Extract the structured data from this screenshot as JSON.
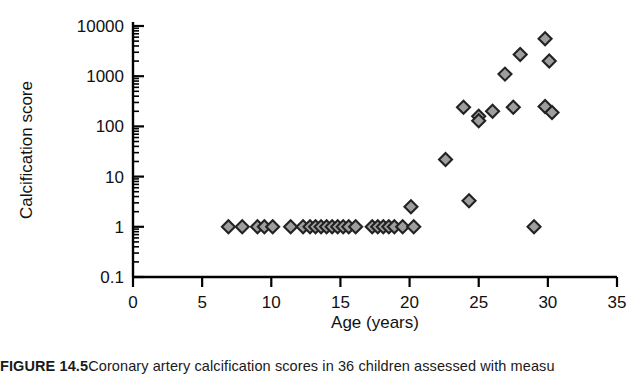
{
  "figure": {
    "caption_label": "FIGURE 14.5",
    "caption_text": "Coronary artery calcification scores in 36 children assessed with measu"
  },
  "chart_data": {
    "type": "scatter",
    "title": "",
    "xlabel": "Age (years)",
    "ylabel": "Calcification score",
    "xlim": [
      0,
      35
    ],
    "ylim": [
      0.1,
      10000
    ],
    "yscale": "log",
    "grid": false,
    "legend": "none",
    "xticks": [
      0,
      5,
      10,
      15,
      20,
      25,
      30,
      35
    ],
    "xtick_labels": [
      "0",
      "5",
      "10",
      "15",
      "20",
      "25",
      "30",
      "35"
    ],
    "yticks": [
      0.1,
      1,
      10,
      100,
      1000,
      10000
    ],
    "ytick_labels": [
      "0.1",
      "1",
      "10",
      "100",
      "1000",
      "10000"
    ],
    "y_minor_ticks": true,
    "marker": "diamond",
    "marker_fill": "#9e9e9e",
    "marker_edge": "#222222",
    "marker_size": 11,
    "points": [
      {
        "x": 6.9,
        "y": 1
      },
      {
        "x": 7.9,
        "y": 1
      },
      {
        "x": 9.0,
        "y": 1
      },
      {
        "x": 9.5,
        "y": 1
      },
      {
        "x": 10.1,
        "y": 1
      },
      {
        "x": 11.4,
        "y": 1
      },
      {
        "x": 12.3,
        "y": 1
      },
      {
        "x": 12.8,
        "y": 1
      },
      {
        "x": 13.2,
        "y": 1
      },
      {
        "x": 13.6,
        "y": 1
      },
      {
        "x": 14.0,
        "y": 1
      },
      {
        "x": 14.4,
        "y": 1
      },
      {
        "x": 14.8,
        "y": 1
      },
      {
        "x": 15.2,
        "y": 1
      },
      {
        "x": 15.6,
        "y": 1
      },
      {
        "x": 16.1,
        "y": 1
      },
      {
        "x": 17.3,
        "y": 1
      },
      {
        "x": 17.7,
        "y": 1
      },
      {
        "x": 18.1,
        "y": 1
      },
      {
        "x": 18.5,
        "y": 1
      },
      {
        "x": 18.9,
        "y": 1
      },
      {
        "x": 19.5,
        "y": 1
      },
      {
        "x": 20.3,
        "y": 1
      },
      {
        "x": 20.1,
        "y": 2.5
      },
      {
        "x": 22.6,
        "y": 22
      },
      {
        "x": 24.3,
        "y": 3.3
      },
      {
        "x": 23.9,
        "y": 240
      },
      {
        "x": 25.0,
        "y": 160
      },
      {
        "x": 25.0,
        "y": 130
      },
      {
        "x": 26.0,
        "y": 200
      },
      {
        "x": 27.5,
        "y": 240
      },
      {
        "x": 26.9,
        "y": 1100
      },
      {
        "x": 28.0,
        "y": 2700
      },
      {
        "x": 29.0,
        "y": 1
      },
      {
        "x": 29.8,
        "y": 5600
      },
      {
        "x": 30.1,
        "y": 2000
      },
      {
        "x": 29.8,
        "y": 250
      },
      {
        "x": 30.3,
        "y": 190
      }
    ]
  }
}
